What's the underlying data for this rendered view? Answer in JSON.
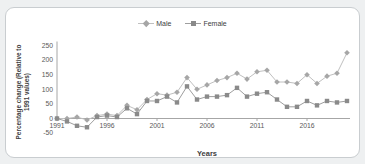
{
  "chart_data": {
    "type": "line",
    "title": "",
    "xlabel": "Years",
    "ylabel": "Percentage change (Relative to 1991 values)",
    "ylabel_line1": "Percentage change (Relative to",
    "ylabel_line2": "1991 values)",
    "x": [
      1991,
      1992,
      1993,
      1994,
      1995,
      1996,
      1997,
      1998,
      1999,
      2000,
      2001,
      2002,
      2003,
      2004,
      2005,
      2006,
      2007,
      2008,
      2009,
      2010,
      2011,
      2012,
      2013,
      2014,
      2015,
      2016,
      2017,
      2018,
      2019,
      2020
    ],
    "series": [
      {
        "name": "Male",
        "marker": "diamond",
        "marker_color": "#a6a6a6",
        "line_color": "#c0c0c0",
        "values": [
          0,
          0,
          5,
          -5,
          10,
          15,
          10,
          45,
          30,
          65,
          85,
          80,
          90,
          140,
          100,
          115,
          130,
          140,
          155,
          135,
          160,
          165,
          125,
          125,
          120,
          150,
          120,
          145,
          155,
          225
        ]
      },
      {
        "name": "Female",
        "marker": "square",
        "marker_color": "#8a8a8a",
        "line_color": "#9e9e9e",
        "values": [
          0,
          -10,
          -25,
          -30,
          5,
          10,
          5,
          35,
          15,
          60,
          60,
          75,
          55,
          110,
          65,
          75,
          75,
          80,
          105,
          75,
          85,
          90,
          65,
          40,
          40,
          60,
          45,
          60,
          55,
          60
        ]
      }
    ],
    "ylim": [
      -50,
      250
    ],
    "y_ticks": [
      -50,
      0,
      50,
      100,
      150,
      200,
      250
    ],
    "x_ticks": [
      1991,
      1996,
      2001,
      2006,
      2011,
      2016
    ],
    "grid": false,
    "legend_position": "top-center"
  },
  "colors": {
    "axis_line": "#a6a6a6",
    "tick_label": "#595959",
    "card_border": "#c9cdd0",
    "card_background": "#ffffff",
    "page_background": "#eef0f1"
  }
}
